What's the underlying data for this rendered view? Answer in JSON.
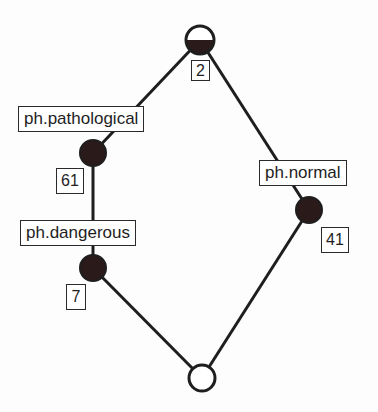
{
  "diagram": {
    "type": "concept-lattice",
    "colors": {
      "line": "#1e1e1e",
      "node_fill": "#2a1a1a",
      "background": "#fdfdfd"
    },
    "nodes": [
      {
        "id": "top",
        "cx": 200,
        "cy": 40,
        "r": 14,
        "fill": "half",
        "count": "2"
      },
      {
        "id": "pathological",
        "cx": 93,
        "cy": 153,
        "r": 13,
        "fill": "full",
        "label": "ph.pathological",
        "count": "61"
      },
      {
        "id": "dangerous",
        "cx": 93,
        "cy": 268,
        "r": 13,
        "fill": "full",
        "label": "ph.dangerous",
        "count": "7"
      },
      {
        "id": "normal",
        "cx": 309,
        "cy": 210,
        "r": 13,
        "fill": "full",
        "label": "ph.normal",
        "count": "41"
      },
      {
        "id": "bottom",
        "cx": 202,
        "cy": 378,
        "r": 13,
        "fill": "none"
      }
    ],
    "edges": [
      [
        "top",
        "pathological"
      ],
      [
        "top",
        "normal"
      ],
      [
        "pathological",
        "dangerous"
      ],
      [
        "dangerous",
        "bottom"
      ],
      [
        "normal",
        "bottom"
      ]
    ],
    "labels": {
      "top_count": "2",
      "pathological": "ph.pathological",
      "pathological_count": "61",
      "dangerous": "ph.dangerous",
      "dangerous_count": "7",
      "normal": "ph.normal",
      "normal_count": "41"
    }
  }
}
